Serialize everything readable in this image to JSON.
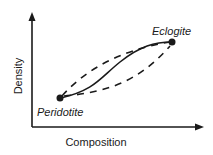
{
  "diagram": {
    "type": "schematic-plot",
    "x_axis_label": "Composition",
    "y_axis_label": "Density",
    "points": [
      {
        "label": "Peridotite",
        "position": "lower-left"
      },
      {
        "label": "Eclogite",
        "position": "upper-right"
      }
    ],
    "curves": [
      {
        "style": "solid",
        "description": "S-shaped path from Peridotite to Eclogite"
      },
      {
        "style": "dashed",
        "description": "upper bounding path"
      },
      {
        "style": "dashed",
        "description": "lower bounding path"
      }
    ],
    "colors": {
      "line": "#1a1a1a",
      "background": "#ffffff"
    }
  }
}
